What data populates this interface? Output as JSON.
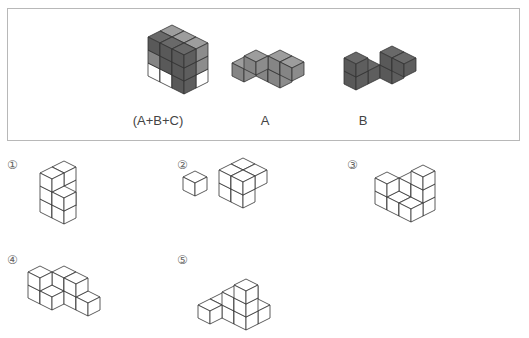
{
  "frame": {
    "x": 7,
    "y": 8,
    "w": 513,
    "h": 133
  },
  "unit": {
    "dx": 12,
    "dy": 6,
    "dz": 13
  },
  "colors": {
    "dark": "#5e5e5e",
    "mid": "#8c8c8c",
    "white": "#ffffff",
    "stroke": "#333333"
  },
  "given": [
    {
      "label": "(A+B+C)",
      "label_x": 158,
      "label_y": 113,
      "origin": [
        172,
        64
      ],
      "cubes": [
        [
          0,
          0,
          0,
          "white"
        ],
        [
          1,
          0,
          0,
          "white"
        ],
        [
          2,
          0,
          0,
          "white"
        ],
        [
          0,
          1,
          0,
          "white"
        ],
        [
          1,
          1,
          0,
          "white"
        ],
        [
          2,
          1,
          0,
          "dark"
        ],
        [
          0,
          0,
          1,
          "mid"
        ],
        [
          1,
          0,
          1,
          "mid"
        ],
        [
          2,
          0,
          1,
          "mid"
        ],
        [
          0,
          1,
          1,
          "mid"
        ],
        [
          1,
          1,
          1,
          "dark"
        ],
        [
          2,
          1,
          1,
          "dark"
        ],
        [
          0,
          0,
          2,
          "mid"
        ],
        [
          1,
          0,
          2,
          "mid"
        ],
        [
          2,
          0,
          2,
          "mid"
        ],
        [
          0,
          1,
          2,
          "dark"
        ],
        [
          1,
          1,
          2,
          "dark"
        ],
        [
          2,
          1,
          2,
          "dark"
        ]
      ]
    },
    {
      "label": "A",
      "label_x": 265,
      "label_y": 113,
      "origin": [
        268,
        70
      ],
      "cubes": [
        [
          0,
          0,
          0,
          "mid"
        ],
        [
          1,
          0,
          0,
          "mid"
        ],
        [
          1,
          0,
          1,
          "mid"
        ],
        [
          2,
          0,
          1,
          "mid"
        ],
        [
          0,
          1,
          1,
          "mid"
        ],
        [
          -1,
          1,
          0,
          "mid"
        ]
      ]
    },
    {
      "label": "B",
      "label_x": 363,
      "label_y": 113,
      "origin": [
        368,
        72
      ],
      "cubes": [
        [
          0,
          0,
          0,
          "dark"
        ],
        [
          0,
          1,
          0,
          "dark"
        ],
        [
          0,
          1,
          1,
          "dark"
        ],
        [
          1,
          -1,
          0,
          "dark"
        ],
        [
          1,
          -1,
          1,
          "dark"
        ],
        [
          2,
          -1,
          1,
          "dark"
        ]
      ]
    }
  ],
  "options": [
    {
      "num": "①",
      "num_x": 7,
      "num_y": 158,
      "origin": [
        52,
        206
      ],
      "cubes": [
        [
          0,
          0,
          0
        ],
        [
          0,
          0,
          1
        ],
        [
          0,
          0,
          2
        ],
        [
          0,
          -1,
          0
        ],
        [
          0,
          -1,
          1
        ],
        [
          0,
          -1,
          2
        ],
        [
          1,
          0,
          0
        ],
        [
          1,
          0,
          1
        ]
      ]
    },
    {
      "num": "②",
      "num_x": 177,
      "num_y": 158,
      "origin": [
        231,
        190
      ],
      "cubes": [
        [
          0,
          0,
          0
        ],
        [
          0,
          0,
          1
        ],
        [
          1,
          0,
          0
        ],
        [
          1,
          0,
          1
        ],
        [
          0,
          -1,
          1
        ],
        [
          1,
          -1,
          1
        ],
        [
          -2,
          1,
          0
        ]
      ]
    },
    {
      "num": "③",
      "num_x": 347,
      "num_y": 158,
      "origin": [
        399,
        204
      ],
      "cubes": [
        [
          0,
          0,
          0
        ],
        [
          1,
          0,
          0
        ],
        [
          0,
          -1,
          0
        ],
        [
          0,
          -1,
          1
        ],
        [
          1,
          -1,
          0
        ],
        [
          1,
          -1,
          1
        ],
        [
          1,
          -1,
          2
        ],
        [
          -1,
          0,
          1
        ],
        [
          -1,
          0,
          0
        ]
      ]
    },
    {
      "num": "④",
      "num_x": 7,
      "num_y": 253,
      "origin": [
        52,
        298
      ],
      "cubes": [
        [
          0,
          0,
          0
        ],
        [
          0,
          -1,
          0
        ],
        [
          0,
          -1,
          1
        ],
        [
          1,
          -1,
          0
        ],
        [
          1,
          -1,
          1
        ],
        [
          2,
          -1,
          0
        ],
        [
          -1,
          0,
          0
        ],
        [
          -1,
          0,
          1
        ]
      ]
    },
    {
      "num": "⑤",
      "num_x": 177,
      "num_y": 253,
      "origin": [
        222,
        306
      ],
      "cubes": [
        [
          0,
          0,
          0
        ],
        [
          1,
          0,
          0
        ],
        [
          2,
          0,
          0
        ],
        [
          2,
          0,
          1
        ],
        [
          2,
          0,
          2
        ],
        [
          1,
          -1,
          1
        ],
        [
          1,
          0,
          1
        ],
        [
          0,
          1,
          0
        ],
        [
          2,
          -1,
          0
        ]
      ]
    }
  ]
}
